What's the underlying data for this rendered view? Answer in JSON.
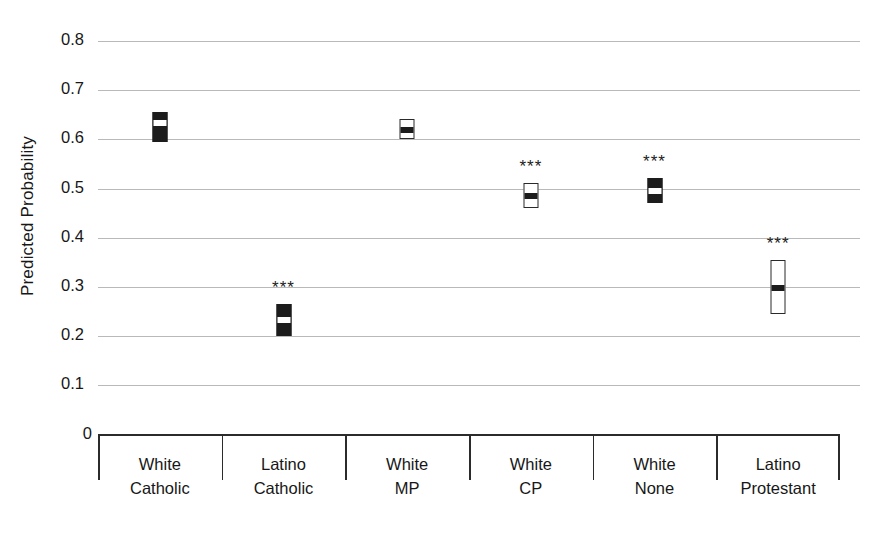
{
  "chart_data": {
    "type": "scatter",
    "title": "",
    "xlabel": "",
    "ylabel": "Predicted Probability",
    "ylim": [
      0,
      0.8
    ],
    "grid": true,
    "legend": "none",
    "ytick_labels": [
      "0.8",
      "0.7",
      "0.6",
      "0.5",
      "0.4",
      "0.3",
      "0.2",
      "0.1",
      "0"
    ],
    "ytick_values": [
      0.8,
      0.7,
      0.6,
      0.5,
      0.4,
      0.3,
      0.2,
      0.1,
      0
    ],
    "categories": [
      "White Catholic",
      "Latino Catholic",
      "White MP",
      "White CP",
      "White None",
      "Latino Protestant"
    ],
    "category_lines": [
      [
        "White",
        "Catholic"
      ],
      [
        "Latino",
        "Catholic"
      ],
      [
        "White",
        "MP"
      ],
      [
        "White",
        "CP"
      ],
      [
        "White",
        "None"
      ],
      [
        "Latino",
        "Protestant"
      ]
    ],
    "values": [
      0.635,
      0.235,
      0.622,
      0.487,
      0.497,
      0.3
    ],
    "ci_low": [
      0.595,
      0.2,
      0.6,
      0.46,
      0.47,
      0.245
    ],
    "ci_high": [
      0.655,
      0.265,
      0.642,
      0.512,
      0.522,
      0.355
    ],
    "marker_styles": [
      "filled",
      "filled",
      "open",
      "open",
      "filled",
      "open"
    ],
    "significance": [
      "",
      "***",
      "",
      "***",
      "***",
      "***"
    ],
    "significance_note": "*** indicates statistically significant difference",
    "series": [
      {
        "name": "Predicted Probability",
        "points": [
          {
            "category": "White Catholic",
            "value": 0.635,
            "ci_low": 0.595,
            "ci_high": 0.655,
            "style": "filled",
            "sig": ""
          },
          {
            "category": "Latino Catholic",
            "value": 0.235,
            "ci_low": 0.2,
            "ci_high": 0.265,
            "style": "filled",
            "sig": "***"
          },
          {
            "category": "White MP",
            "value": 0.622,
            "ci_low": 0.6,
            "ci_high": 0.642,
            "style": "open",
            "sig": ""
          },
          {
            "category": "White CP",
            "value": 0.487,
            "ci_low": 0.46,
            "ci_high": 0.512,
            "style": "open",
            "sig": "***"
          },
          {
            "category": "White None",
            "value": 0.497,
            "ci_low": 0.47,
            "ci_high": 0.522,
            "style": "filled",
            "sig": "***"
          },
          {
            "category": "Latino Protestant",
            "value": 0.3,
            "ci_low": 0.245,
            "ci_high": 0.355,
            "style": "open",
            "sig": "***"
          }
        ]
      }
    ],
    "colors": {
      "gridline": "#b9b9b9",
      "axis": "#2b2b2b",
      "marker_fill": "#1c1c1c",
      "marker_open_fill": "#ffffff",
      "text": "#171717",
      "background": "#ffffff"
    }
  }
}
